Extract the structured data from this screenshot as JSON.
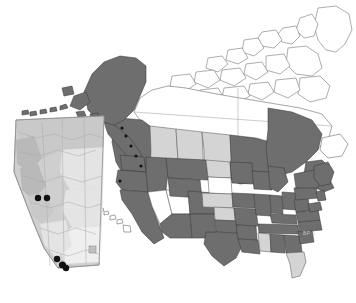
{
  "figure": {
    "width": 356,
    "height": 303,
    "background": "#ffffff",
    "credit_label": "BP 1"
  },
  "legend_colors": {
    "highlighted_fill": "#6e6e6e",
    "secondary_fill": "#d4d4d4",
    "absent_fill": "#ffffff",
    "outline_stroke": "#5c5c5c",
    "occurrence_dot": "#111111",
    "inset_frame": "#8d8d8d"
  },
  "main_map": {
    "name": "north-america-choropleth",
    "projection_note": "North America, Alaska and Hawaii inset at true position",
    "regions": [
      {
        "code": "AK",
        "name": "Alaska",
        "shade": "highlighted"
      },
      {
        "code": "HI",
        "name": "Hawaii",
        "shade": "absent"
      },
      {
        "code": "WA",
        "name": "Washington",
        "shade": "highlighted"
      },
      {
        "code": "OR",
        "name": "Oregon",
        "shade": "highlighted"
      },
      {
        "code": "CA",
        "name": "California",
        "shade": "highlighted"
      },
      {
        "code": "ID",
        "name": "Idaho",
        "shade": "highlighted"
      },
      {
        "code": "NV",
        "name": "Nevada",
        "shade": "absent"
      },
      {
        "code": "UT",
        "name": "Utah",
        "shade": "absent"
      },
      {
        "code": "AZ",
        "name": "Arizona",
        "shade": "highlighted"
      },
      {
        "code": "MT",
        "name": "Montana",
        "shade": "highlighted"
      },
      {
        "code": "WY",
        "name": "Wyoming",
        "shade": "highlighted"
      },
      {
        "code": "CO",
        "name": "Colorado",
        "shade": "highlighted"
      },
      {
        "code": "NM",
        "name": "New Mexico",
        "shade": "highlighted"
      },
      {
        "code": "ND",
        "name": "North Dakota",
        "shade": "secondary"
      },
      {
        "code": "SD",
        "name": "South Dakota",
        "shade": "absent"
      },
      {
        "code": "NE",
        "name": "Nebraska",
        "shade": "secondary"
      },
      {
        "code": "KS",
        "name": "Kansas",
        "shade": "secondary"
      },
      {
        "code": "OK",
        "name": "Oklahoma",
        "shade": "highlighted"
      },
      {
        "code": "TX",
        "name": "Texas",
        "shade": "highlighted"
      },
      {
        "code": "MN",
        "name": "Minnesota",
        "shade": "highlighted"
      },
      {
        "code": "IA",
        "name": "Iowa",
        "shade": "highlighted"
      },
      {
        "code": "MO",
        "name": "Missouri",
        "shade": "highlighted"
      },
      {
        "code": "AR",
        "name": "Arkansas",
        "shade": "highlighted"
      },
      {
        "code": "LA",
        "name": "Louisiana",
        "shade": "highlighted"
      },
      {
        "code": "WI",
        "name": "Wisconsin",
        "shade": "highlighted"
      },
      {
        "code": "IL",
        "name": "Illinois",
        "shade": "highlighted"
      },
      {
        "code": "MI",
        "name": "Michigan",
        "shade": "highlighted"
      },
      {
        "code": "IN",
        "name": "Indiana",
        "shade": "highlighted"
      },
      {
        "code": "OH",
        "name": "Ohio",
        "shade": "highlighted"
      },
      {
        "code": "KY",
        "name": "Kentucky",
        "shade": "highlighted"
      },
      {
        "code": "TN",
        "name": "Tennessee",
        "shade": "highlighted"
      },
      {
        "code": "MS",
        "name": "Mississippi",
        "shade": "secondary"
      },
      {
        "code": "AL",
        "name": "Alabama",
        "shade": "highlighted"
      },
      {
        "code": "GA",
        "name": "Georgia",
        "shade": "highlighted"
      },
      {
        "code": "FL",
        "name": "Florida",
        "shade": "secondary"
      },
      {
        "code": "SC",
        "name": "South Carolina",
        "shade": "highlighted"
      },
      {
        "code": "NC",
        "name": "North Carolina",
        "shade": "highlighted"
      },
      {
        "code": "VA",
        "name": "Virginia",
        "shade": "highlighted"
      },
      {
        "code": "WV",
        "name": "West Virginia",
        "shade": "highlighted"
      },
      {
        "code": "MD",
        "name": "Maryland",
        "shade": "highlighted"
      },
      {
        "code": "PA",
        "name": "Pennsylvania",
        "shade": "highlighted"
      },
      {
        "code": "NY",
        "name": "New York",
        "shade": "highlighted"
      },
      {
        "code": "NJ",
        "name": "New Jersey",
        "shade": "highlighted"
      },
      {
        "code": "NE-ENG",
        "name": "New England",
        "shade": "highlighted"
      },
      {
        "code": "BC",
        "name": "British Columbia",
        "shade": "highlighted"
      },
      {
        "code": "AB",
        "name": "Alberta",
        "shade": "secondary"
      },
      {
        "code": "SK",
        "name": "Saskatchewan",
        "shade": "secondary"
      },
      {
        "code": "MB",
        "name": "Manitoba",
        "shade": "secondary"
      },
      {
        "code": "ON",
        "name": "Ontario",
        "shade": "highlighted"
      },
      {
        "code": "QC",
        "name": "Quebec",
        "shade": "highlighted"
      },
      {
        "code": "NB",
        "name": "New Brunswick",
        "shade": "highlighted"
      },
      {
        "code": "NS",
        "name": "Nova Scotia",
        "shade": "highlighted"
      },
      {
        "code": "NL",
        "name": "Newfoundland",
        "shade": "absent"
      },
      {
        "code": "YT",
        "name": "Yukon",
        "shade": "absent"
      },
      {
        "code": "NT",
        "name": "Northwest Territories",
        "shade": "absent"
      },
      {
        "code": "NU",
        "name": "Nunavut",
        "shade": "absent"
      },
      {
        "code": "GL",
        "name": "Greenland",
        "shade": "absent"
      }
    ]
  },
  "inset_map": {
    "name": "alberta-inset",
    "region_label": "Alberta",
    "style": "shaded-relief terrain",
    "frame_box": {
      "x": 10,
      "y": 114,
      "width": 98,
      "height": 155
    },
    "occurrence_points": [
      {
        "id": 1,
        "x": 38,
        "y": 198
      },
      {
        "id": 2,
        "x": 47,
        "y": 198
      },
      {
        "id": 3,
        "x": 57,
        "y": 259
      },
      {
        "id": 4,
        "x": 62,
        "y": 265
      },
      {
        "id": 5,
        "x": 65,
        "y": 268
      }
    ],
    "point_count": 5,
    "point_radius": 3.2
  }
}
